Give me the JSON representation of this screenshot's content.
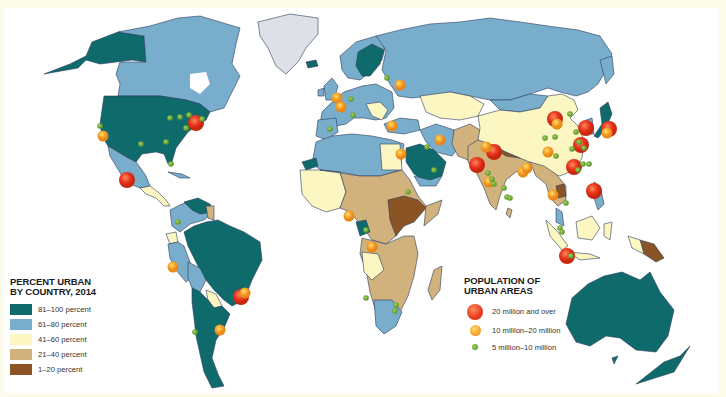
{
  "map": {
    "title": "Percent urban by country and population of urban areas, 2014",
    "background": "#ffffff",
    "frame_color": "#fdfbe9",
    "ocean_color": "#ffffff",
    "border_color": "#2b3a5c",
    "no_data_color": "#dde0e6"
  },
  "legend_urban": {
    "title_line1": "PERCENT URBAN",
    "title_line2": "BY COUNTRY, 2014",
    "classes": [
      {
        "label": "81–100 percent",
        "color": "#0f6b6b"
      },
      {
        "label": "61–80 percent",
        "color": "#78aecb"
      },
      {
        "label": "41–60 percent",
        "color": "#fbf6c2"
      },
      {
        "label": "21–40 percent",
        "color": "#d1b27c"
      },
      {
        "label": "1–20 percent",
        "color": "#8a5424"
      }
    ]
  },
  "legend_population": {
    "title_line1": "POPULATION OF",
    "title_line2": "URBAN AREAS",
    "classes": [
      {
        "label": "20 million and over",
        "color": "#e8371e",
        "size": 16
      },
      {
        "label": "10 million–20 million",
        "color": "#f6a126",
        "size": 11
      },
      {
        "label": "5 million–10 million",
        "color": "#5c9a2a",
        "size": 6
      }
    ]
  },
  "cities": [
    {
      "x": 196,
      "y": 123,
      "cls": 0
    },
    {
      "x": 127,
      "y": 180,
      "cls": 0
    },
    {
      "x": 103,
      "y": 136,
      "cls": 1
    },
    {
      "x": 100,
      "y": 126,
      "cls": 2
    },
    {
      "x": 170,
      "y": 118,
      "cls": 2
    },
    {
      "x": 180,
      "y": 117,
      "cls": 2
    },
    {
      "x": 189,
      "y": 115,
      "cls": 2
    },
    {
      "x": 186,
      "y": 128,
      "cls": 2
    },
    {
      "x": 141,
      "y": 144,
      "cls": 2
    },
    {
      "x": 166,
      "y": 142,
      "cls": 2
    },
    {
      "x": 171,
      "y": 164,
      "cls": 2
    },
    {
      "x": 202,
      "y": 119,
      "cls": 2
    },
    {
      "x": 241,
      "y": 297,
      "cls": 0
    },
    {
      "x": 245,
      "y": 293,
      "cls": 1
    },
    {
      "x": 220,
      "y": 330,
      "cls": 1
    },
    {
      "x": 173,
      "y": 267,
      "cls": 1
    },
    {
      "x": 178,
      "y": 222,
      "cls": 2
    },
    {
      "x": 195,
      "y": 332,
      "cls": 2
    },
    {
      "x": 337,
      "y": 98,
      "cls": 1
    },
    {
      "x": 341,
      "y": 107,
      "cls": 1
    },
    {
      "x": 351,
      "y": 99,
      "cls": 2
    },
    {
      "x": 353,
      "y": 115,
      "cls": 2
    },
    {
      "x": 330,
      "y": 129,
      "cls": 2
    },
    {
      "x": 387,
      "y": 78,
      "cls": 2
    },
    {
      "x": 400,
      "y": 85,
      "cls": 1
    },
    {
      "x": 392,
      "y": 126,
      "cls": 1
    },
    {
      "x": 440,
      "y": 140,
      "cls": 1
    },
    {
      "x": 401,
      "y": 154,
      "cls": 1
    },
    {
      "x": 427,
      "y": 147,
      "cls": 2
    },
    {
      "x": 434,
      "y": 170,
      "cls": 2
    },
    {
      "x": 408,
      "y": 192,
      "cls": 2
    },
    {
      "x": 349,
      "y": 216,
      "cls": 1
    },
    {
      "x": 372,
      "y": 247,
      "cls": 1
    },
    {
      "x": 366,
      "y": 230,
      "cls": 2
    },
    {
      "x": 366,
      "y": 298,
      "cls": 2
    },
    {
      "x": 395,
      "y": 311,
      "cls": 2
    },
    {
      "x": 396,
      "y": 305,
      "cls": 2
    },
    {
      "x": 477,
      "y": 165,
      "cls": 0
    },
    {
      "x": 494,
      "y": 152,
      "cls": 0
    },
    {
      "x": 486,
      "y": 147,
      "cls": 1
    },
    {
      "x": 488,
      "y": 173,
      "cls": 2
    },
    {
      "x": 492,
      "y": 179,
      "cls": 2
    },
    {
      "x": 494,
      "y": 184,
      "cls": 2
    },
    {
      "x": 489,
      "y": 182,
      "cls": 1
    },
    {
      "x": 504,
      "y": 188,
      "cls": 2
    },
    {
      "x": 507,
      "y": 197,
      "cls": 2
    },
    {
      "x": 510,
      "y": 198,
      "cls": 2
    },
    {
      "x": 523,
      "y": 172,
      "cls": 1
    },
    {
      "x": 527,
      "y": 168,
      "cls": 1
    },
    {
      "x": 555,
      "y": 119,
      "cls": 0
    },
    {
      "x": 557,
      "y": 124,
      "cls": 1
    },
    {
      "x": 570,
      "y": 114,
      "cls": 2
    },
    {
      "x": 586,
      "y": 128,
      "cls": 0
    },
    {
      "x": 576,
      "y": 132,
      "cls": 2
    },
    {
      "x": 555,
      "y": 137,
      "cls": 2
    },
    {
      "x": 581,
      "y": 145,
      "cls": 0
    },
    {
      "x": 579,
      "y": 142,
      "cls": 2
    },
    {
      "x": 584,
      "y": 148,
      "cls": 2
    },
    {
      "x": 572,
      "y": 149,
      "cls": 2
    },
    {
      "x": 548,
      "y": 152,
      "cls": 1
    },
    {
      "x": 556,
      "y": 156,
      "cls": 2
    },
    {
      "x": 574,
      "y": 167,
      "cls": 0
    },
    {
      "x": 578,
      "y": 170,
      "cls": 2
    },
    {
      "x": 583,
      "y": 164,
      "cls": 2
    },
    {
      "x": 589,
      "y": 164,
      "cls": 2
    },
    {
      "x": 609,
      "y": 129,
      "cls": 0
    },
    {
      "x": 607,
      "y": 133,
      "cls": 1
    },
    {
      "x": 553,
      "y": 195,
      "cls": 1
    },
    {
      "x": 594,
      "y": 191,
      "cls": 0
    },
    {
      "x": 567,
      "y": 256,
      "cls": 0
    },
    {
      "x": 571,
      "y": 256,
      "cls": 2
    },
    {
      "x": 560,
      "y": 228,
      "cls": 2
    },
    {
      "x": 562,
      "y": 232,
      "cls": 2
    },
    {
      "x": 566,
      "y": 203,
      "cls": 2
    },
    {
      "x": 545,
      "y": 138,
      "cls": 2
    }
  ]
}
